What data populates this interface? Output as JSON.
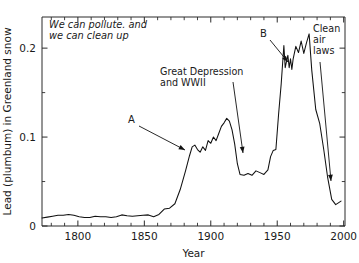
{
  "chart_data": {
    "type": "line",
    "title": "",
    "xlabel": "Year",
    "ylabel": "Lead (plumbum) in Greenland snow",
    "xlim": [
      1773,
      2001
    ],
    "ylim": [
      0,
      0.235
    ],
    "grid": false,
    "legend": "none",
    "xticks": [
      1800,
      1850,
      1900,
      1950,
      2000
    ],
    "xtick_labels": [
      "1800",
      "1850",
      "1900",
      "1950",
      "2000"
    ],
    "yticks": [
      0,
      0.1,
      0.2
    ],
    "ytick_labels": [
      "0",
      "0.1",
      "0.2"
    ],
    "x_minor_step": 10,
    "y_minor_step": 0.05,
    "series_name": "Lead concentration",
    "x": [
      1773,
      1777,
      1781,
      1785,
      1789,
      1793,
      1797,
      1801,
      1805,
      1809,
      1813,
      1817,
      1821,
      1825,
      1829,
      1833,
      1837,
      1841,
      1845,
      1849,
      1853,
      1857,
      1861,
      1865,
      1869,
      1873,
      1877,
      1881,
      1884,
      1886,
      1888,
      1890,
      1892,
      1894,
      1896,
      1898,
      1900,
      1902,
      1904,
      1906,
      1908,
      1910,
      1912,
      1914,
      1916,
      1918,
      1920,
      1922,
      1925,
      1928,
      1931,
      1934,
      1937,
      1940,
      1943,
      1945,
      1947,
      1949,
      1951,
      1953,
      1955,
      1956,
      1958,
      1959,
      1960,
      1961,
      1962,
      1964,
      1966,
      1968,
      1970,
      1972,
      1974,
      1976,
      1979,
      1982,
      1985,
      1988,
      1991,
      1994,
      1996,
      1998
    ],
    "y": [
      0.009,
      0.01,
      0.011,
      0.012,
      0.012,
      0.013,
      0.012,
      0.0105,
      0.0095,
      0.0095,
      0.011,
      0.0105,
      0.0105,
      0.0095,
      0.0105,
      0.0125,
      0.0115,
      0.011,
      0.0115,
      0.012,
      0.0125,
      0.0105,
      0.013,
      0.019,
      0.02,
      0.025,
      0.041,
      0.062,
      0.079,
      0.089,
      0.091,
      0.086,
      0.083,
      0.089,
      0.085,
      0.096,
      0.093,
      0.1,
      0.096,
      0.104,
      0.112,
      0.116,
      0.121,
      0.118,
      0.108,
      0.092,
      0.07,
      0.058,
      0.057,
      0.059,
      0.057,
      0.062,
      0.06,
      0.058,
      0.063,
      0.078,
      0.085,
      0.086,
      0.125,
      0.16,
      0.203,
      0.178,
      0.192,
      0.178,
      0.188,
      0.176,
      0.188,
      0.202,
      0.195,
      0.208,
      0.194,
      0.206,
      0.216,
      0.175,
      0.131,
      0.115,
      0.086,
      0.054,
      0.03,
      0.024,
      0.026,
      0.028
    ],
    "annotations": [
      {
        "name": "headline-note",
        "text_lines": [
          "We can pollute. and",
          "we can clean up"
        ],
        "style": "italic",
        "x_px": 49,
        "y_px": 28
      },
      {
        "name": "marker-a",
        "text_lines": [
          "A"
        ],
        "style": "plain",
        "x_px": 128,
        "y_px": 123,
        "arrow": {
          "x1": 139,
          "y1": 126,
          "x2": 185,
          "y2": 150
        }
      },
      {
        "name": "great-depression-note",
        "text_lines": [
          "Great Depression",
          "and  WWII"
        ],
        "style": "plain",
        "x_px": 160,
        "y_px": 75,
        "arrow": {
          "x1": 233,
          "y1": 82,
          "x2": 243,
          "y2": 153
        }
      },
      {
        "name": "marker-b",
        "text_lines": [
          "B"
        ],
        "style": "plain",
        "x_px": 260,
        "y_px": 37,
        "arrow": {
          "x1": 270,
          "y1": 40,
          "x2": 288,
          "y2": 62
        }
      },
      {
        "name": "clean-air-laws-note",
        "text_lines": [
          "Clean",
          "air",
          "laws"
        ],
        "style": "plain",
        "x_px": 313,
        "y_px": 32,
        "arrow": {
          "x1": 320,
          "y1": 62,
          "x2": 331,
          "y2": 181
        }
      }
    ]
  },
  "colors": {
    "line": "#111111",
    "axis": "#2b2b2b",
    "text": "#1a1a1a",
    "background": "#ffffff"
  }
}
